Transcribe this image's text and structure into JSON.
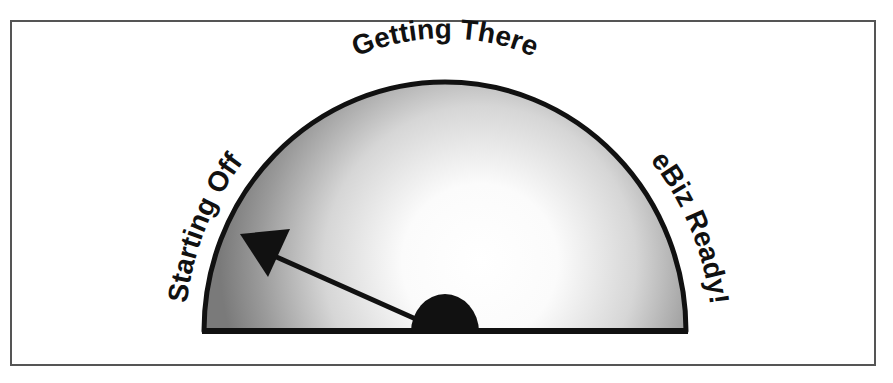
{
  "diagram": {
    "type": "gauge",
    "labels": {
      "left": "Starting Off",
      "top": "Getting There",
      "right": "eBiz Ready!"
    },
    "pointer": {
      "angle_deg": 150,
      "points_toward": "Starting Off"
    },
    "colors": {
      "outline": "#111111",
      "fill_center": "#ffffff",
      "fill_edge": "#7a7a7a",
      "frame": "#555555"
    }
  }
}
